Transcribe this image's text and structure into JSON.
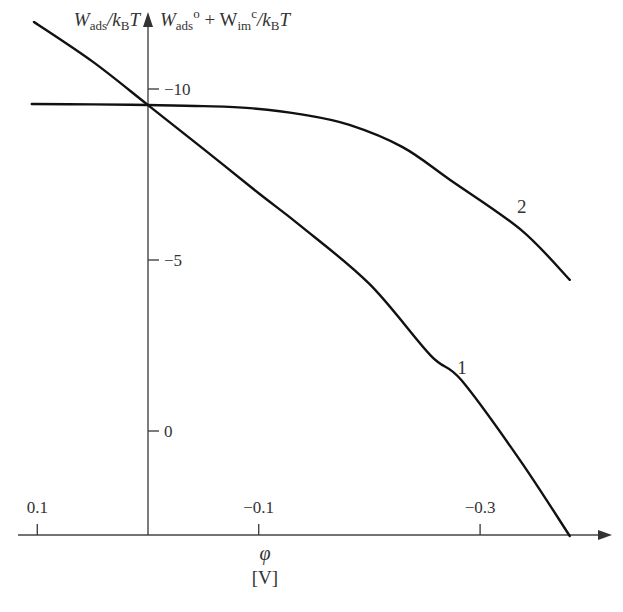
{
  "chart_data": {
    "type": "line",
    "title": "",
    "xlabel": "φ",
    "xunit": "[V]",
    "ylabel_left": {
      "main": "W",
      "sub": "ads",
      "rest": "/k",
      "sub2": "B",
      "tail": "T"
    },
    "ylabel_right": {
      "main": "W",
      "sub": "ads",
      "sup": "o",
      "plus": " + W",
      "sub2": "im",
      "sup2": "c",
      "rest": "/k",
      "sub3": "B",
      "tail": "T"
    },
    "x_axis_reversed": true,
    "xlim": [
      0.1,
      -0.4
    ],
    "ylim": [
      3.5,
      -12.5
    ],
    "x_ticks": [
      {
        "value": 0.1,
        "label": "0.1"
      },
      {
        "value": -0.1,
        "label": "−0.1"
      },
      {
        "value": -0.3,
        "label": "−0.3"
      }
    ],
    "y_ticks": [
      {
        "value": -10,
        "label": "−10"
      },
      {
        "value": -5,
        "label": "−5"
      },
      {
        "value": 0,
        "label": "0"
      }
    ],
    "grid": false,
    "series": [
      {
        "name": "1",
        "x": [
          0.103,
          0.05,
          0,
          -0.05,
          -0.1,
          -0.137,
          -0.2,
          -0.255,
          -0.283,
          -0.336,
          -0.381
        ],
        "y": [
          -11.96,
          -10.8,
          -9.53,
          -8.25,
          -6.95,
          -6.02,
          -4.3,
          -2.22,
          -1.49,
          0.85,
          3.07
        ]
      },
      {
        "name": "2",
        "x": [
          0.105,
          0.05,
          0,
          -0.05,
          -0.092,
          -0.14,
          -0.182,
          -0.23,
          -0.273,
          -0.337,
          -0.381
        ],
        "y": [
          -9.56,
          -9.55,
          -9.53,
          -9.5,
          -9.44,
          -9.25,
          -8.95,
          -8.3,
          -7.34,
          -5.88,
          -4.42
        ]
      }
    ],
    "annotations": [
      {
        "text": "1",
        "x": -0.283,
        "y": -1.6,
        "series": "1"
      },
      {
        "text": "2",
        "x": -0.337,
        "y": -5.9,
        "series": "2"
      }
    ]
  }
}
